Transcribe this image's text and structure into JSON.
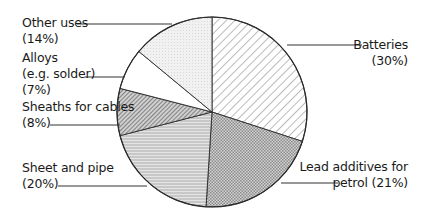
{
  "chart_data": {
    "type": "pie",
    "title": "",
    "start_angle_deg": 0,
    "direction": "clockwise",
    "categories": [
      "Batteries",
      "Lead additives for petrol",
      "Sheet and pipe",
      "Sheaths for cables",
      "Alloys (e.g. solder)",
      "Other uses"
    ],
    "values": [
      30,
      21,
      20,
      8,
      7,
      14
    ],
    "unit": "%",
    "slices": [
      {
        "label": "Batteries",
        "value": 30,
        "pattern": "diagonal-hatch-wide"
      },
      {
        "label": "Lead additives for petrol",
        "value": 21,
        "pattern": "fine-crosshatch-dark"
      },
      {
        "label": "Sheet and pipe",
        "value": 20,
        "pattern": "horizontal-lines"
      },
      {
        "label": "Sheaths for cables",
        "value": 8,
        "pattern": "diagonal-hatch-dense"
      },
      {
        "label": "Alloys (e.g. solder)",
        "value": 7,
        "pattern": "none"
      },
      {
        "label": "Other uses",
        "value": 14,
        "pattern": "light-dots"
      }
    ],
    "legend": "inline leader-line labels"
  },
  "labels": {
    "other_uses": {
      "line1": "Other uses",
      "line2": "(14%)"
    },
    "alloys": {
      "line1": "Alloys",
      "line2": "(e.g. solder)",
      "line3": "(7%)"
    },
    "sheaths": {
      "line1": "Sheaths for cables",
      "line2": "(8%)"
    },
    "sheet_pipe": {
      "line1": "Sheet and pipe",
      "line2": "(20%)"
    },
    "batteries": {
      "line1": "Batteries",
      "line2": "(30%)"
    },
    "lead_additives": {
      "line1": "Lead additives for",
      "line2": "petrol (21%)"
    }
  },
  "colors": {
    "outline": "#2a2a2a",
    "batteries_fill": "#ffffff",
    "lead_fill": "#bdbdbd",
    "sheet_fill": "#d6d6d6",
    "sheaths_fill": "#9a9a9a",
    "alloys_fill": "#ffffff",
    "other_fill": "#efefef"
  }
}
